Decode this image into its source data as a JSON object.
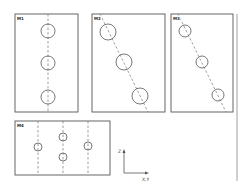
{
  "diagram": {
    "colors": {
      "stroke": "#555555",
      "dash": "#777777",
      "background": "#ffffff"
    },
    "panels": [
      {
        "id": "M1",
        "label": "M1",
        "box": {
          "x": 15,
          "y": 14,
          "w": 63,
          "h": 98
        },
        "line": {
          "x1": 48,
          "y1": 14,
          "x2": 48,
          "y2": 112
        },
        "circles": [
          {
            "cx": 48,
            "cy": 31,
            "r": 7
          },
          {
            "cx": 48,
            "cy": 63,
            "r": 7
          },
          {
            "cx": 48,
            "cy": 97,
            "r": 7
          }
        ]
      },
      {
        "id": "M2",
        "label": "M2",
        "box": {
          "x": 92,
          "y": 14,
          "w": 73,
          "h": 98
        },
        "line": {
          "x1": 100,
          "y1": 14,
          "x2": 148,
          "y2": 112
        },
        "circles": [
          {
            "cx": 108,
            "cy": 32,
            "r": 8
          },
          {
            "cx": 124,
            "cy": 62,
            "r": 8
          },
          {
            "cx": 140,
            "cy": 96,
            "r": 8
          }
        ]
      },
      {
        "id": "M3",
        "label": "M3",
        "box": {
          "x": 171,
          "y": 14,
          "w": 62,
          "h": 98
        },
        "line": {
          "x1": 178,
          "y1": 14,
          "x2": 226,
          "y2": 112
        },
        "circles": [
          {
            "cx": 185,
            "cy": 31,
            "r": 6
          },
          {
            "cx": 202,
            "cy": 62,
            "r": 6
          },
          {
            "cx": 218,
            "cy": 95,
            "r": 6
          }
        ]
      },
      {
        "id": "M4",
        "label": "M4",
        "box": {
          "x": 15,
          "y": 121,
          "w": 95,
          "h": 54
        },
        "lines": [
          {
            "x": 38
          },
          {
            "x": 63
          },
          {
            "x": 88
          }
        ],
        "circles": [
          {
            "cx": 38,
            "cy": 147,
            "r": 4
          },
          {
            "cx": 63,
            "cy": 137,
            "r": 4
          },
          {
            "cx": 63,
            "cy": 157,
            "r": 4
          },
          {
            "cx": 88,
            "cy": 146,
            "r": 4
          }
        ]
      }
    ],
    "axes": {
      "origin": {
        "x": 124,
        "y": 173
      },
      "vertical_label": "Z",
      "horizontal_label": "X,Y"
    },
    "separator": {
      "x": 237,
      "y1": 14,
      "y2": 181
    }
  }
}
